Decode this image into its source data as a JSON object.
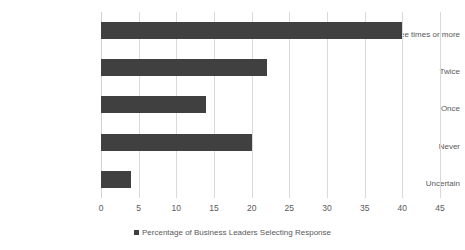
{
  "chart_data": {
    "type": "bar",
    "orientation": "horizontal",
    "title": "",
    "xlabel": "",
    "ylabel": "",
    "categories": [
      "Three times or more",
      "Twice",
      "Once",
      "Never",
      "Uncertain"
    ],
    "values": [
      40,
      22,
      14,
      20,
      4
    ],
    "series": [
      {
        "name": "Percentage of Business Leaders Selecting Response",
        "values": [
          40,
          22,
          14,
          20,
          4
        ]
      }
    ],
    "xlim": [
      0,
      45
    ],
    "xticks": [
      0,
      5,
      10,
      15,
      20,
      25,
      30,
      35,
      40,
      45
    ],
    "xticklabels": [
      "0",
      "5",
      "10",
      "15",
      "20",
      "25",
      "30",
      "35",
      "40",
      "45"
    ],
    "grid": "vertical",
    "legend": {
      "position": "bottom",
      "entries": [
        {
          "label": "Percentage of Business Leaders Selecting Response",
          "color": "#404040"
        }
      ]
    },
    "colors": {
      "bar": "#404040",
      "gridline": "#d9d9d9",
      "text": "#595959",
      "background": "#ffffff"
    }
  }
}
